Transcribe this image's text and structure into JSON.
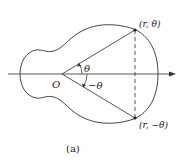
{
  "figure": {
    "caption": "(a)",
    "origin_label": "O",
    "point_upper_label": "(r, θ)",
    "point_lower_label": "(r, −θ)",
    "angle_upper_label": "θ",
    "angle_lower_label": "−θ"
  },
  "colors": {
    "stroke": "#444444",
    "text": "#222222",
    "background": "#ffffff"
  }
}
